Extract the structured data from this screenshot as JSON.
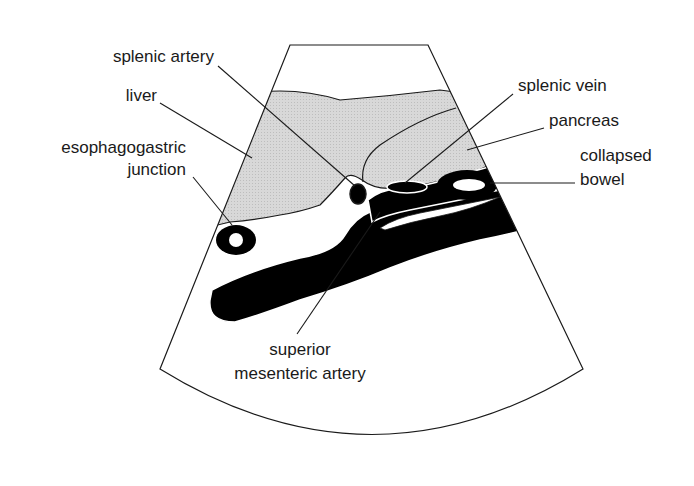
{
  "diagram": {
    "colors": {
      "outline": "#1a1a1a",
      "soft_tissue_fill": "#d4d4d4",
      "fluid_fill": "#000000",
      "background": "#ffffff"
    },
    "labels": {
      "splenic_artery": "splenic artery",
      "liver": "liver",
      "ej_line1": "esophagogastric",
      "ej_line2": "junction",
      "splenic_vein": "splenic vein",
      "pancreas": "pancreas",
      "bowel_line1": "collapsed",
      "bowel_line2": "bowel",
      "sma_line1": "superior",
      "sma_line2": "mesenteric artery"
    }
  }
}
